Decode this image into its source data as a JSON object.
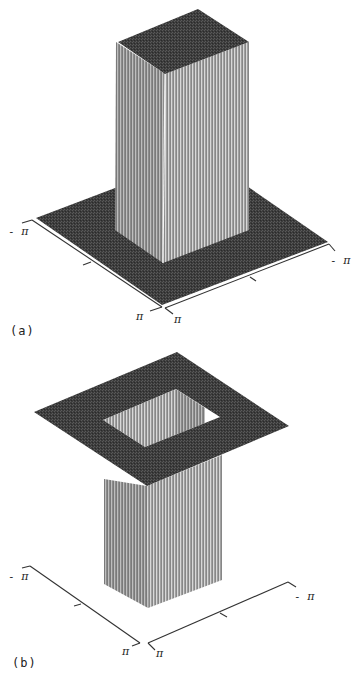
{
  "colors": {
    "background": "#ffffff",
    "plane_dark": "#3c3c3c",
    "plane_speckle": "#5a5a5a",
    "face_left": "#8c8c8c",
    "face_right": "#a0a0a0",
    "stripe_light": "#e6e6e6",
    "stripe_dark": "#6e6e6e",
    "axis": "#333333",
    "hole_white": "#ffffff"
  },
  "chart_data": [
    {
      "panel": "(a)",
      "type": "surface3d",
      "title": "",
      "description": "3D rendering of a 2D rectangular (box) function: a raised square pillar centered on a flat square base plane",
      "x_axis": {
        "range_labels": [
          "- π",
          "π"
        ],
        "ticks": 3
      },
      "y_axis": {
        "range_labels": [
          "- π",
          "π"
        ],
        "ticks": 3
      },
      "surface": {
        "base_level": 0,
        "pillar_level": 1,
        "pillar_extent_fraction": 0.5
      },
      "geometry": {
        "base_plane": [
          [
            36,
            218
          ],
          [
            202,
            155
          ],
          [
            328,
            242
          ],
          [
            162,
            305
          ]
        ],
        "pillar_top": [
          [
            118,
            42
          ],
          [
            198,
            9
          ],
          [
            249,
            42
          ],
          [
            165,
            74
          ]
        ],
        "pillar_left_face": [
          [
            116,
            42
          ],
          [
            165,
            74
          ],
          [
            163,
            263
          ],
          [
            115,
            230
          ]
        ],
        "pillar_right_face": [
          [
            165,
            74
          ],
          [
            249,
            42
          ],
          [
            249,
            230
          ],
          [
            163,
            263
          ]
        ],
        "left_axis": {
          "line": [
            [
              32,
              220
            ],
            [
              162,
              307
            ]
          ],
          "ticks": [
            [
              [
                22,
                223
              ],
              [
                32,
                220
              ]
            ],
            [
              [
                83,
                265
              ],
              [
                91,
                262
              ]
            ],
            [
              [
                162,
                307
              ],
              [
                150,
                311
              ]
            ]
          ]
        },
        "right_axis": {
          "line": [
            [
              165,
              308
            ],
            [
              329,
              244
            ]
          ],
          "ticks": [
            [
              [
                165,
                308
              ],
              [
                173,
                314
              ]
            ],
            [
              [
                250,
                277
              ],
              [
                256,
                281
              ]
            ],
            [
              [
                329,
                244
              ],
              [
                335,
                251
              ]
            ]
          ]
        },
        "labels": [
          {
            "text": "- π",
            "x": 8,
            "y": 226
          },
          {
            "text": "π",
            "x": 136,
            "y": 311
          },
          {
            "text": "- π",
            "x": 330,
            "y": 255
          },
          {
            "text": "π",
            "x": 174,
            "y": 314
          }
        ],
        "panel_label": {
          "text": "(a)",
          "x": 10,
          "y": 325
        }
      }
    },
    {
      "panel": "(b)",
      "type": "surface3d",
      "title": "",
      "description": "3D rendering of the complementary function: a raised flat square plane with a square hole in the center, the hole region dropping down to a low square column",
      "x_axis": {
        "range_labels": [
          "- π",
          "π"
        ],
        "ticks": 3
      },
      "y_axis": {
        "range_labels": [
          "- π",
          "π"
        ],
        "ticks": 3
      },
      "surface": {
        "outer_level": 1,
        "hole_level": 0,
        "hole_extent_fraction": 0.5
      },
      "geometry": {
        "top_plane": [
          [
            34,
            73
          ],
          [
            177,
            13
          ],
          [
            289,
            87
          ],
          [
            147,
            147
          ]
        ],
        "hole": [
          [
            103,
            81
          ],
          [
            176,
            50
          ],
          [
            220,
            78
          ],
          [
            145,
            108
          ]
        ],
        "hole_inner_back_left": [
          [
            103,
            81
          ],
          [
            176,
            50
          ],
          [
            176,
            120
          ],
          [
            103,
            151
          ]
        ],
        "hole_inner_back_right": [
          [
            176,
            50
          ],
          [
            205,
            69
          ],
          [
            205,
            139
          ],
          [
            176,
            120
          ]
        ],
        "hole_white_gap": [
          [
            205,
            69
          ],
          [
            220,
            78
          ],
          [
            205,
            88
          ]
        ],
        "pillar_left_face": [
          [
            104,
            140
          ],
          [
            147,
            147
          ],
          [
            148,
            269
          ],
          [
            104,
            245
          ]
        ],
        "pillar_right_face": [
          [
            147,
            147
          ],
          [
            222,
            116
          ],
          [
            222,
            241
          ],
          [
            148,
            269
          ]
        ],
        "left_axis": {
          "line": [
            [
              30,
              227
            ],
            [
              140,
              304
            ]
          ],
          "ticks": [
            [
              [
                22,
                229
              ],
              [
                30,
                227
              ]
            ],
            [
              [
                74,
                267
              ],
              [
                81,
                265
              ]
            ],
            [
              [
                140,
                304
              ],
              [
                132,
                307
              ]
            ]
          ]
        },
        "right_axis": {
          "line": [
            [
              148,
              304
            ],
            [
              288,
              243
            ]
          ],
          "ticks": [
            [
              [
                148,
                304
              ],
              [
                155,
                311
              ]
            ],
            [
              [
                220,
                274
              ],
              [
                227,
                278
              ]
            ],
            [
              [
                288,
                243
              ],
              [
                296,
                248
              ]
            ]
          ]
        },
        "labels": [
          {
            "text": "- π",
            "x": 8,
            "y": 232
          },
          {
            "text": "π",
            "x": 122,
            "y": 307
          },
          {
            "text": "- π",
            "x": 294,
            "y": 252
          },
          {
            "text": "π",
            "x": 156,
            "y": 309
          }
        ],
        "panel_label": {
          "text": "(b)",
          "x": 12,
          "y": 318
        }
      }
    }
  ]
}
